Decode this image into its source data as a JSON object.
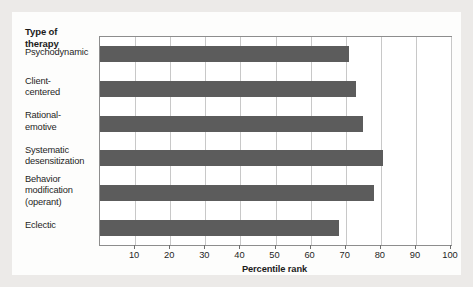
{
  "chart_data": {
    "type": "bar",
    "orientation": "horizontal",
    "title": "",
    "ylabel": "Type of\ntherapy",
    "xlabel": "Percentile rank",
    "xlim": [
      0,
      100
    ],
    "xticks": [
      10,
      20,
      30,
      40,
      50,
      60,
      70,
      80,
      90,
      100
    ],
    "grid": true,
    "legend": "none",
    "categories": [
      "Psychodynamic",
      "Client-\ncentered",
      "Rational-\nemotive",
      "Systematic\ndesensitization",
      "Behavior\nmodification\n(operant)",
      "Eclectic"
    ],
    "values": [
      71,
      73,
      75,
      80.5,
      78,
      68
    ],
    "bar_color": "#5c5c5c"
  },
  "axis_heading": {
    "line1": "Type of",
    "line2": "therapy"
  },
  "categories": [
    {
      "label": "Psychodynamic",
      "lines": [
        "Psychodynamic"
      ]
    },
    {
      "label": "Client-centered",
      "lines": [
        "Client-",
        "centered"
      ]
    },
    {
      "label": "Rational-emotive",
      "lines": [
        "Rational-",
        "emotive"
      ]
    },
    {
      "label": "Systematic desensitization",
      "lines": [
        "Systematic",
        "desensitization"
      ]
    },
    {
      "label": "Behavior modification (operant)",
      "lines": [
        "Behavior",
        "modification",
        "(operant)"
      ]
    },
    {
      "label": "Eclectic",
      "lines": [
        "Eclectic"
      ]
    }
  ],
  "x_axis": {
    "label": "Percentile rank",
    "ticks": [
      "10",
      "20",
      "30",
      "40",
      "50",
      "60",
      "70",
      "80",
      "90",
      "100"
    ]
  },
  "colors": {
    "bar": "#5c5c5c",
    "gridline": "#c8c8c8",
    "frame": "#8d8d8d",
    "panel": "#fdfdfc",
    "background": "#eceae8"
  }
}
